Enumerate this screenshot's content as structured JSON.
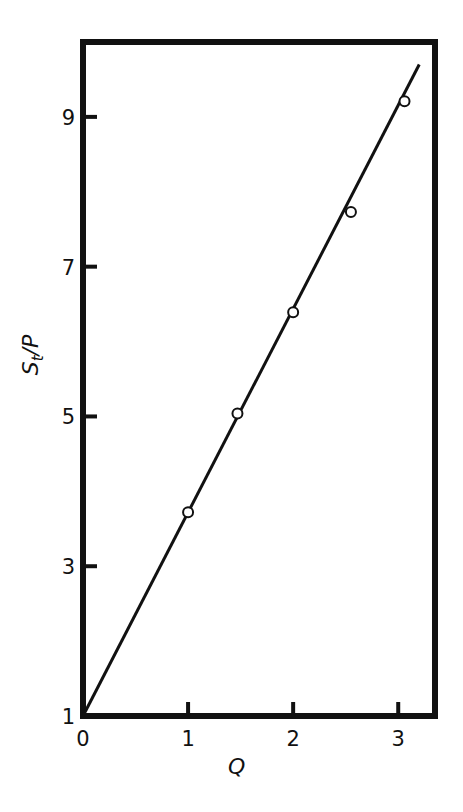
{
  "chart_data": {
    "type": "scatter",
    "title": "",
    "xlabel": "Q",
    "ylabel": "S_t/P",
    "ylabel_parts": {
      "base": "S",
      "sub": "t",
      "rest": "/P"
    },
    "xlim": [
      0,
      3.35
    ],
    "ylim": [
      1,
      10
    ],
    "x_ticks": [
      0,
      1,
      2,
      3
    ],
    "y_ticks": [
      1,
      3,
      5,
      7,
      9
    ],
    "x_tick_labels": [
      "0",
      "1",
      "2",
      "3"
    ],
    "y_tick_labels": [
      "1",
      "3",
      "5",
      "7",
      "9"
    ],
    "grid": false,
    "legend": null,
    "series": [
      {
        "name": "measured",
        "marker": "open-circle",
        "points": [
          {
            "x": 1.0,
            "y": 3.72
          },
          {
            "x": 1.47,
            "y": 5.04
          },
          {
            "x": 2.0,
            "y": 6.39
          },
          {
            "x": 2.55,
            "y": 7.73
          },
          {
            "x": 3.06,
            "y": 9.21
          }
        ]
      },
      {
        "name": "fit-line",
        "style": "solid-line",
        "points": [
          {
            "x": 0.0,
            "y": 1.0
          },
          {
            "x": 3.2,
            "y": 9.7
          }
        ]
      }
    ]
  }
}
